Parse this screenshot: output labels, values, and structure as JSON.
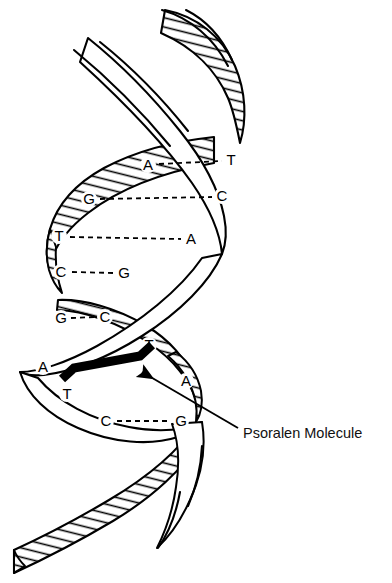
{
  "figure": {
    "background_color": "#ffffff",
    "ink_color": "#000000",
    "psoralen_color": "#000000"
  },
  "callout": {
    "label": "Psoralen Molecule",
    "label_x": 243,
    "label_y": 434,
    "arrow_from_x": 238,
    "arrow_from_y": 428,
    "arrow_to_x": 142,
    "arrow_to_y": 372
  },
  "base_pairs": [
    {
      "index": 0,
      "left_base": "A",
      "right_base": "T",
      "left_x": 148,
      "left_y": 165,
      "right_x": 231,
      "right_y": 160,
      "bond_x1": 159,
      "bond_y1": 164,
      "bond_x2": 222,
      "bond_y2": 161,
      "bond_style": "dashed"
    },
    {
      "index": 1,
      "left_base": "G",
      "right_base": "C",
      "left_x": 89,
      "left_y": 199,
      "right_x": 222,
      "right_y": 196,
      "bond_x1": 100,
      "bond_y1": 199,
      "bond_x2": 212,
      "bond_y2": 197,
      "bond_style": "dashed"
    },
    {
      "index": 2,
      "left_base": "T",
      "right_base": "A",
      "left_x": 59,
      "left_y": 236,
      "right_x": 191,
      "right_y": 239,
      "bond_x1": 70,
      "bond_y1": 237,
      "bond_x2": 181,
      "bond_y2": 239,
      "bond_style": "dashed"
    },
    {
      "index": 3,
      "left_base": "C",
      "right_base": "G",
      "left_x": 61,
      "left_y": 272,
      "right_x": 124,
      "right_y": 273,
      "bond_x1": 72,
      "bond_y1": 272,
      "bond_x2": 114,
      "bond_y2": 273,
      "bond_style": "dashed"
    },
    {
      "index": 4,
      "left_base": "G",
      "right_base": "C",
      "left_x": 61,
      "left_y": 318,
      "right_x": 105,
      "right_y": 317,
      "bond_x1": 71,
      "bond_y1": 318,
      "bond_x2": 96,
      "bond_y2": 317,
      "bond_style": "dashed"
    },
    {
      "index": 5,
      "left_base": "T",
      "right_base": "",
      "left_x": 149,
      "left_y": 345,
      "right_x": 0,
      "right_y": 0,
      "bond_x1": 0,
      "bond_y1": 0,
      "bond_x2": 0,
      "bond_y2": 0,
      "bond_style": "none"
    },
    {
      "index": 6,
      "left_base": "A",
      "right_base": "A",
      "left_x": 43,
      "left_y": 367,
      "right_x": 186,
      "right_y": 381,
      "bond_x1": 0,
      "bond_y1": 0,
      "bond_x2": 0,
      "bond_y2": 0,
      "bond_style": "none"
    },
    {
      "index": 7,
      "left_base": "T",
      "right_base": "",
      "left_x": 67,
      "left_y": 394,
      "right_x": 0,
      "right_y": 0,
      "bond_x1": 0,
      "bond_y1": 0,
      "bond_x2": 0,
      "bond_y2": 0,
      "bond_style": "none"
    },
    {
      "index": 8,
      "left_base": "C",
      "right_base": "G",
      "left_x": 106,
      "left_y": 421,
      "right_x": 181,
      "right_y": 421,
      "bond_x1": 117,
      "bond_y1": 421,
      "bond_x2": 171,
      "bond_y2": 421,
      "bond_style": "dashed"
    }
  ],
  "icons": {
    "arrow": "arrow-pointer-icon",
    "psoralen": "psoralen-bar-icon"
  }
}
